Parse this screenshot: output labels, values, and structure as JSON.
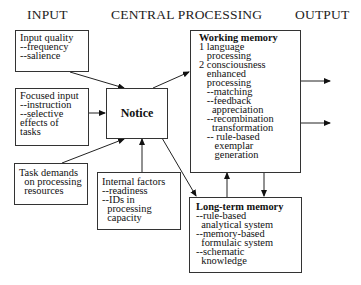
{
  "headers": {
    "input": "INPUT",
    "central": "CENTRAL PROCESSING",
    "output": "OUTPUT"
  },
  "boxes": {
    "input_quality": {
      "title": "Input quality",
      "lines": [
        "--frequency",
        "--salience"
      ]
    },
    "focused_input": {
      "title": "Focused input",
      "lines": [
        "--instruction",
        "--selective",
        "effects of",
        "tasks"
      ]
    },
    "task_demands": {
      "lines": [
        "Task demands",
        "  on processing",
        "  resources"
      ]
    },
    "notice": {
      "title": "Notice"
    },
    "internal_factors": {
      "title": "Internal factors",
      "lines": [
        "--readiness",
        "--IDs in",
        "  processing",
        "  capacity"
      ]
    },
    "working_memory": {
      "title": "Working memory",
      "lines": [
        "1 language",
        "   processing",
        "2 consciousness",
        "   enhanced",
        "   processing",
        "   --matching",
        "   --feedback",
        "     appreciation",
        "   --recombination",
        "     transformation",
        "   -- rule-based",
        "      exemplar",
        "      generation"
      ]
    },
    "long_term_memory": {
      "title": "Long-term memory",
      "lines": [
        "--rule-based",
        "  analytical system",
        "--memory-based",
        "  formulaic system",
        "--schematic",
        "  knowledge"
      ]
    }
  }
}
